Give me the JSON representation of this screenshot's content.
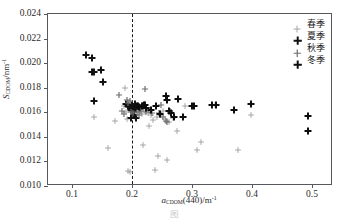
{
  "chart_data": {
    "type": "scatter",
    "title": "",
    "xlabel": "a_CDOM(440)/m^-1",
    "ylabel": "S_CDOM/nm^-1",
    "xlabel_parts": {
      "sym": "a",
      "sub": "CDOM",
      "mid": "(440)/m",
      "sup": "-1"
    },
    "ylabel_parts": {
      "sym": "S",
      "sub": "CDOM",
      "mid": "/nm",
      "sup": "-1"
    },
    "xlim": [
      0.06,
      0.535
    ],
    "ylim": [
      0.01,
      0.024
    ],
    "xticks": [
      0.1,
      0.2,
      0.3,
      0.4,
      0.5
    ],
    "xtick_labels": [
      "0.1",
      "0.2",
      "0.3",
      "0.4",
      "0.5"
    ],
    "yticks": [
      0.01,
      0.012,
      0.014,
      0.016,
      0.018,
      0.02,
      0.022,
      0.024
    ],
    "ytick_labels": [
      "0.010",
      "0.012",
      "0.014",
      "0.016",
      "0.018",
      "0.020",
      "0.022",
      "0.024"
    ],
    "grid": false,
    "legend_position": "top-right",
    "annotations": [
      {
        "type": "vline",
        "x": 0.2,
        "style": "dashed",
        "color": "#1a1a1a"
      }
    ],
    "series": [
      {
        "name": "春季",
        "marker": "plus",
        "color": "#9c9c9c",
        "weight": "thin",
        "points": [
          [
            0.137,
            0.0156
          ],
          [
            0.172,
            0.01532
          ],
          [
            0.16,
            0.01312
          ],
          [
            0.188,
            0.018
          ],
          [
            0.186,
            0.01655
          ],
          [
            0.19,
            0.016
          ],
          [
            0.192,
            0.01549
          ],
          [
            0.194,
            0.01122
          ],
          [
            0.197,
            0.0111
          ],
          [
            0.205,
            0.01562
          ],
          [
            0.212,
            0.01603
          ],
          [
            0.216,
            0.0159
          ],
          [
            0.219,
            0.01333
          ],
          [
            0.222,
            0.01608
          ],
          [
            0.226,
            0.01598
          ],
          [
            0.228,
            0.01487
          ],
          [
            0.232,
            0.01578
          ],
          [
            0.235,
            0.01535
          ],
          [
            0.238,
            0.01133
          ],
          [
            0.241,
            0.01559
          ],
          [
            0.243,
            0.01243
          ],
          [
            0.248,
            0.01575
          ],
          [
            0.252,
            0.01608
          ],
          [
            0.255,
            0.01545
          ],
          [
            0.258,
            0.01215
          ],
          [
            0.262,
            0.01525
          ],
          [
            0.268,
            0.01555
          ],
          [
            0.275,
            0.01444
          ],
          [
            0.288,
            0.0165
          ],
          [
            0.308,
            0.0129
          ],
          [
            0.315,
            0.01358
          ],
          [
            0.338,
            0.0166
          ],
          [
            0.376,
            0.01292
          ],
          [
            0.399,
            0.01578
          ]
        ]
      },
      {
        "name": "夏季",
        "marker": "plus",
        "color": "#121212",
        "weight": "bold",
        "points": [
          [
            0.124,
            0.02068
          ],
          [
            0.133,
            0.0204
          ],
          [
            0.134,
            0.0193
          ],
          [
            0.137,
            0.01928
          ],
          [
            0.149,
            0.01945
          ],
          [
            0.152,
            0.0185
          ],
          [
            0.136,
            0.01688
          ],
          [
            0.19,
            0.01668
          ],
          [
            0.194,
            0.01655
          ],
          [
            0.196,
            0.01642
          ],
          [
            0.198,
            0.0162
          ],
          [
            0.2,
            0.01662
          ],
          [
            0.201,
            0.01608
          ],
          [
            0.203,
            0.01645
          ],
          [
            0.205,
            0.0167
          ],
          [
            0.207,
            0.01628
          ],
          [
            0.21,
            0.01648
          ],
          [
            0.213,
            0.01632
          ],
          [
            0.218,
            0.01655
          ],
          [
            0.221,
            0.01662
          ],
          [
            0.204,
            0.0158
          ],
          [
            0.207,
            0.01555
          ],
          [
            0.199,
            0.01552
          ]
        ]
      },
      {
        "name": "秋季",
        "marker": "plus",
        "color": "#6e6e6e",
        "weight": "medium",
        "points": [
          [
            0.178,
            0.01742
          ],
          [
            0.183,
            0.01612
          ],
          [
            0.186,
            0.01588
          ],
          [
            0.191,
            0.017
          ],
          [
            0.193,
            0.01672
          ],
          [
            0.196,
            0.01692
          ],
          [
            0.199,
            0.01605
          ],
          [
            0.202,
            0.01592
          ],
          [
            0.208,
            0.016
          ],
          [
            0.211,
            0.01575
          ],
          [
            0.215,
            0.01612
          ],
          [
            0.224,
            0.016
          ],
          [
            0.229,
            0.01618
          ],
          [
            0.233,
            0.01596
          ],
          [
            0.245,
            0.01592
          ],
          [
            0.251,
            0.0156
          ],
          [
            0.256,
            0.01532
          ],
          [
            0.259,
            0.01525
          ],
          [
            0.264,
            0.0161
          ],
          [
            0.222,
            0.01788
          ],
          [
            0.248,
            0.0166
          ]
        ]
      },
      {
        "name": "冬季",
        "marker": "plus",
        "color": "#0d0d0d",
        "weight": "bold",
        "points": [
          [
            0.209,
            0.01655
          ],
          [
            0.212,
            0.0164
          ],
          [
            0.216,
            0.01648
          ],
          [
            0.22,
            0.0166
          ],
          [
            0.223,
            0.01632
          ],
          [
            0.232,
            0.01615
          ],
          [
            0.24,
            0.01655
          ],
          [
            0.246,
            0.0159
          ],
          [
            0.256,
            0.01735
          ],
          [
            0.259,
            0.017
          ],
          [
            0.262,
            0.0161
          ],
          [
            0.265,
            0.01592
          ],
          [
            0.27,
            0.01565
          ],
          [
            0.277,
            0.01705
          ],
          [
            0.285,
            0.0156
          ],
          [
            0.3,
            0.0165
          ],
          [
            0.304,
            0.01652
          ],
          [
            0.333,
            0.01662
          ],
          [
            0.34,
            0.0166
          ],
          [
            0.37,
            0.01615
          ],
          [
            0.398,
            0.01668
          ],
          [
            0.493,
            0.0157
          ],
          [
            0.493,
            0.01448
          ]
        ]
      }
    ]
  },
  "legend": {
    "items": [
      {
        "label": "春季",
        "color": "#9c9c9c",
        "weight": "thin"
      },
      {
        "label": "夏季",
        "color": "#121212",
        "weight": "bold"
      },
      {
        "label": "秋季",
        "color": "#6e6e6e",
        "weight": "medium"
      },
      {
        "label": "冬季",
        "color": "#0d0d0d",
        "weight": "bold"
      }
    ]
  },
  "caption": {
    "text": "图"
  }
}
